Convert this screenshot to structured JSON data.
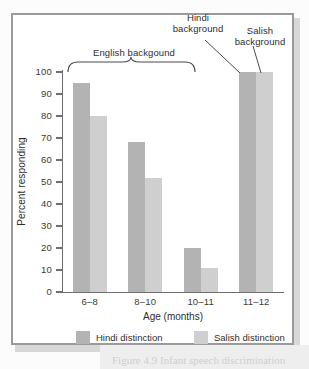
{
  "figure": {
    "frame_color": "#9a9a9a",
    "background": "#ffffff"
  },
  "chart_data": {
    "type": "bar",
    "title": "",
    "subtitle": "",
    "xlabel": "Age (months)",
    "ylabel": "Percent responding",
    "categories": [
      "6–8",
      "8–10",
      "10–11",
      "11–12"
    ],
    "series": [
      {
        "name": "Hindi distinction",
        "color": "#b3b3b3",
        "values": [
          95,
          68,
          20,
          100
        ]
      },
      {
        "name": "Salish distinction",
        "color": "#cfcfcf",
        "values": [
          80,
          52,
          11,
          100
        ]
      }
    ],
    "ylim": [
      0,
      100
    ],
    "ytick_labels": [
      "0",
      "10",
      "20",
      "30",
      "40",
      "50",
      "60",
      "70",
      "80",
      "90",
      "100"
    ],
    "ytick_values": [
      0,
      10,
      20,
      30,
      40,
      50,
      60,
      70,
      80,
      90,
      100
    ],
    "grid": false,
    "legend_position": "bottom",
    "annotations": [
      {
        "text": "English backgound",
        "type": "brace-label",
        "covers": [
          "6–8",
          "8–10",
          "10–11"
        ]
      },
      {
        "text": "Hindi background",
        "type": "leader-label",
        "points_to": "11–12 Hindi distinction bar"
      },
      {
        "text": "Salish background",
        "type": "leader-label",
        "points_to": "11–12 Salish distinction bar"
      }
    ]
  },
  "legend": {
    "entries": [
      {
        "label": "Hindi distinction",
        "color": "#b3b3b3"
      },
      {
        "label": "Salish distinction",
        "color": "#cfcfcf"
      }
    ]
  },
  "caption": {
    "fragment": "Figure 4.9 Infant speech discrimination"
  }
}
